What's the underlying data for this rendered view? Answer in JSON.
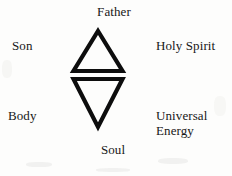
{
  "diagram": {
    "background_color": "#fdfdfc",
    "stroke_color": "#0d0d0d",
    "text_color": "#171717",
    "labels": {
      "top": "Father",
      "upper_left": "Son",
      "upper_right": "Holy Spirit",
      "lower_left": "Body",
      "lower_right_line1": "Universal",
      "lower_right_line2": "Energy",
      "bottom": "Soul"
    },
    "shapes": [
      {
        "name": "upward-triangle",
        "orientation": "up",
        "apex": [
          98,
          30
        ],
        "left_vertex": [
          73,
          72
        ],
        "right_vertex": [
          123,
          72
        ],
        "fill": "none",
        "stroke": "#0d0d0d",
        "stroke_width": 4
      },
      {
        "name": "downward-triangle",
        "orientation": "down",
        "left_vertex": [
          73,
          78
        ],
        "right_vertex": [
          123,
          78
        ],
        "apex": [
          98,
          128
        ],
        "fill": "none",
        "stroke": "#0d0d0d",
        "stroke_width": 4
      }
    ]
  }
}
